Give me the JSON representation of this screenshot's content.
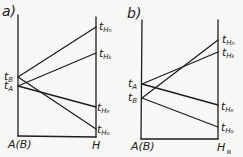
{
  "panels": [
    {
      "label": "a)",
      "left_axis_label": "A(B)",
      "right_axis_label": "H",
      "left_points": [
        {
          "name": "t",
          "sub": "B",
          "y": 77
        },
        {
          "name": "t",
          "sub": "A",
          "y": 86
        }
      ],
      "right_points": [
        {
          "name": "t",
          "sub": "H",
          "subsub": "n",
          "y": 27
        },
        {
          "name": "t",
          "sub": "H",
          "subsub": "k",
          "y": 53
        },
        {
          "name": "t",
          "sub": "H",
          "subsub": "e",
          "y": 107
        },
        {
          "name": "t",
          "sub": "H",
          "subsub": "o",
          "y": 129
        }
      ],
      "lines": [
        [
          "B",
          "Hn"
        ],
        [
          "B",
          "Ho"
        ],
        [
          "A",
          "Hk"
        ],
        [
          "A",
          "He"
        ]
      ]
    },
    {
      "label": "b)",
      "left_axis_label": "A(B)",
      "right_axis_label": "H",
      "left_points": [
        {
          "name": "t",
          "sub": "A",
          "y": 84
        },
        {
          "name": "t",
          "sub": "B",
          "y": 98
        }
      ],
      "right_points": [
        {
          "name": "t",
          "sub": "H",
          "subsub": "n",
          "y": 40
        },
        {
          "name": "t",
          "sub": "H",
          "subsub": "k",
          "y": 52
        },
        {
          "name": "t",
          "sub": "H",
          "subsub": "e",
          "y": 105
        },
        {
          "name": "t",
          "sub": "H",
          "subsub": "o",
          "y": 127
        }
      ],
      "lines": [
        [
          "A",
          "Hk"
        ],
        [
          "A",
          "He"
        ],
        [
          "B",
          "Hn"
        ],
        [
          "B",
          "Ho"
        ]
      ]
    }
  ],
  "colors": {
    "line": "#1e1e1e",
    "background": "#f7f7f5"
  }
}
